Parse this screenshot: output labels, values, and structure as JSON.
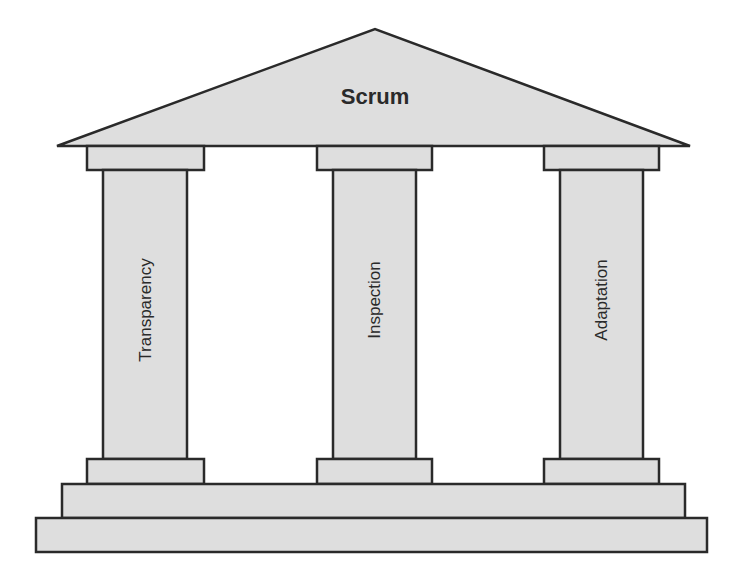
{
  "diagram": {
    "title": "Scrum",
    "pillars": [
      {
        "label": "Transparency"
      },
      {
        "label": "Inspection"
      },
      {
        "label": "Adaptation"
      }
    ],
    "colors": {
      "fill": "#dedede",
      "stroke": "#2a2a2a",
      "background": "#ffffff"
    }
  }
}
